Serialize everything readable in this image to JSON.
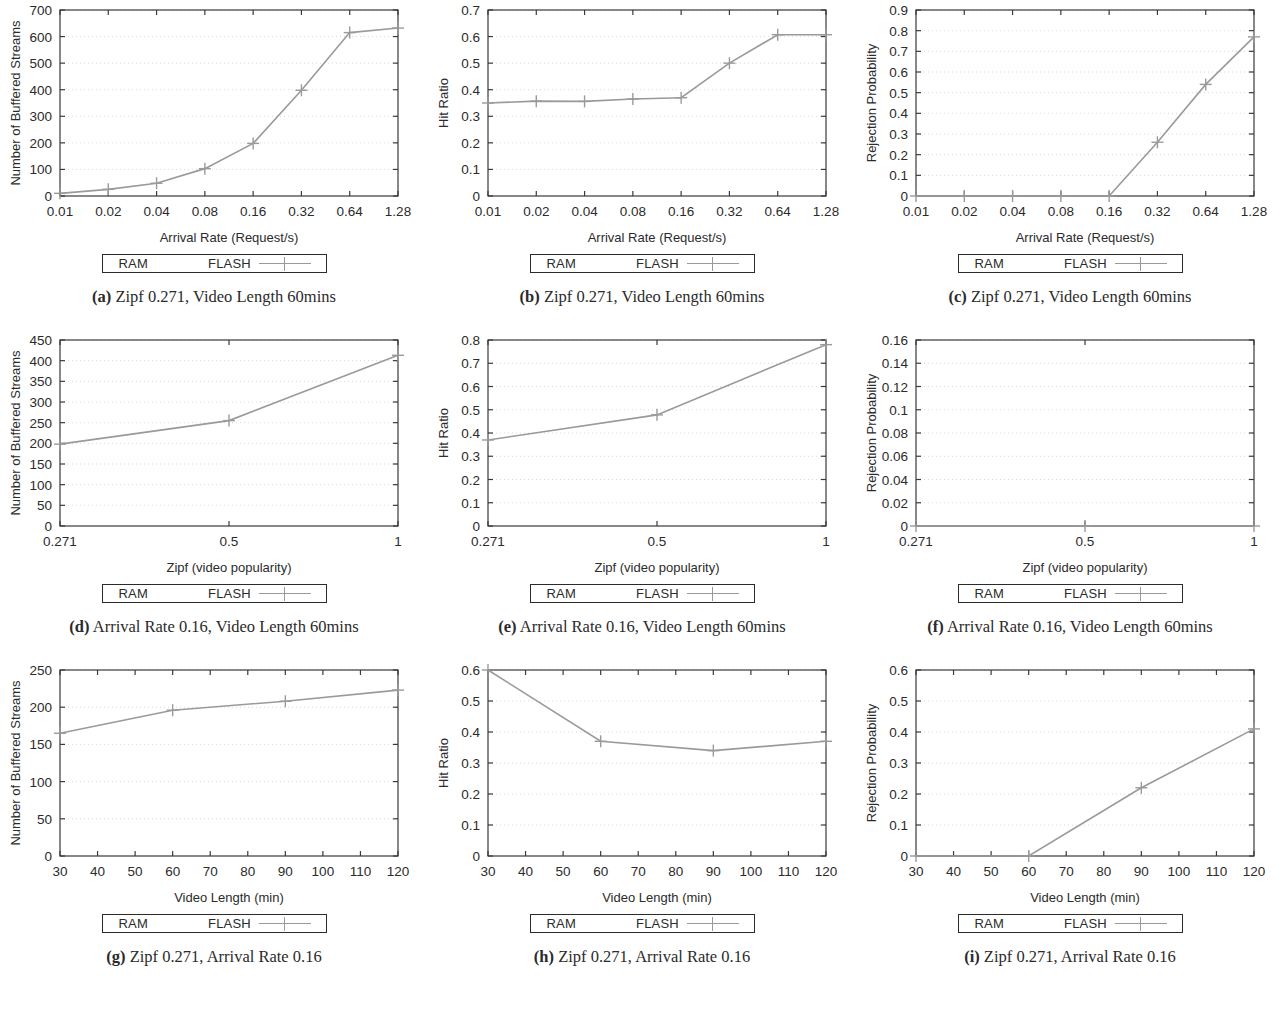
{
  "figure": {
    "legend": {
      "ram_label": "RAM",
      "flash_label": "FLASH"
    },
    "colors": {
      "line": "#9a9a9a",
      "grid": "#d8d8d8",
      "frame": "#3a3a3a",
      "text": "#2b2b2b"
    }
  },
  "chart_data": [
    {
      "id": "a",
      "type": "line",
      "caption_tag": "(a)",
      "caption": "Zipf 0.271, Video Length 60mins",
      "title": "",
      "xlabel": "Arrival Rate (Request/s)",
      "ylabel": "Number of Buffered Streams",
      "xticklabels": [
        "0.01",
        "0.02",
        "0.04",
        "0.08",
        "0.16",
        "0.32",
        "0.64",
        "1.28"
      ],
      "x": [
        1,
        2,
        3,
        4,
        5,
        6,
        7,
        8
      ],
      "yticks": [
        0,
        100,
        200,
        300,
        400,
        500,
        600,
        700
      ],
      "yticklabels": [
        "0",
        "100",
        "200",
        "300",
        "400",
        "500",
        "600",
        "700"
      ],
      "ylim": [
        0,
        700
      ],
      "grid": true,
      "legend_position": "below",
      "series": [
        {
          "name": "FLASH",
          "values": [
            10,
            25,
            48,
            103,
            198,
            398,
            615,
            632
          ]
        }
      ]
    },
    {
      "id": "b",
      "type": "line",
      "caption_tag": "(b)",
      "caption": "Zipf 0.271, Video Length 60mins",
      "title": "",
      "xlabel": "Arrival Rate (Request/s)",
      "ylabel": "Hit Ratio",
      "xticklabels": [
        "0.01",
        "0.02",
        "0.04",
        "0.08",
        "0.16",
        "0.32",
        "0.64",
        "1.28"
      ],
      "x": [
        1,
        2,
        3,
        4,
        5,
        6,
        7,
        8
      ],
      "yticks": [
        0,
        0.1,
        0.2,
        0.3,
        0.4,
        0.5,
        0.6,
        0.7
      ],
      "yticklabels": [
        "0",
        "0.1",
        "0.2",
        "0.3",
        "0.4",
        "0.5",
        "0.6",
        "0.7"
      ],
      "ylim": [
        0,
        0.7
      ],
      "grid": true,
      "legend_position": "below",
      "series": [
        {
          "name": "FLASH",
          "values": [
            0.35,
            0.357,
            0.356,
            0.365,
            0.37,
            0.5,
            0.607,
            0.607
          ]
        }
      ]
    },
    {
      "id": "c",
      "type": "line",
      "caption_tag": "(c)",
      "caption": "Zipf 0.271, Video Length 60mins",
      "title": "",
      "xlabel": "Arrival Rate (Request/s)",
      "ylabel": "Rejection Probability",
      "xticklabels": [
        "0.01",
        "0.02",
        "0.04",
        "0.08",
        "0.16",
        "0.32",
        "0.64",
        "1.28"
      ],
      "x": [
        1,
        2,
        3,
        4,
        5,
        6,
        7,
        8
      ],
      "yticks": [
        0,
        0.1,
        0.2,
        0.3,
        0.4,
        0.5,
        0.6,
        0.7,
        0.8,
        0.9
      ],
      "yticklabels": [
        "0",
        "0.1",
        "0.2",
        "0.3",
        "0.4",
        "0.5",
        "0.6",
        "0.7",
        "0.8",
        "0.9"
      ],
      "ylim": [
        0,
        0.9
      ],
      "grid": true,
      "legend_position": "below",
      "series": [
        {
          "name": "FLASH",
          "values": [
            0,
            0,
            0,
            0,
            0,
            0.26,
            0.54,
            0.77
          ]
        }
      ]
    },
    {
      "id": "d",
      "type": "line",
      "caption_tag": "(d)",
      "caption": "Arrival Rate 0.16, Video Length 60mins",
      "title": "",
      "xlabel": "Zipf (video popularity)",
      "ylabel": "Number of Buffered Streams",
      "xticklabels": [
        "0.271",
        "0.5",
        "1"
      ],
      "x": [
        0.271,
        0.5,
        1
      ],
      "yticks": [
        0,
        50,
        100,
        150,
        200,
        250,
        300,
        350,
        400,
        450
      ],
      "yticklabels": [
        "0",
        "50",
        "100",
        "150",
        "200",
        "250",
        "300",
        "350",
        "400",
        "450"
      ],
      "ylim": [
        0,
        450
      ],
      "grid": true,
      "legend_position": "below",
      "series": [
        {
          "name": "FLASH",
          "values": [
            198,
            255,
            413
          ]
        }
      ]
    },
    {
      "id": "e",
      "type": "line",
      "caption_tag": "(e)",
      "caption": "Arrival Rate 0.16, Video Length 60mins",
      "title": "",
      "xlabel": "Zipf (video popularity)",
      "ylabel": "Hit Ratio",
      "xticklabels": [
        "0.271",
        "0.5",
        "1"
      ],
      "x": [
        0.271,
        0.5,
        1
      ],
      "yticks": [
        0,
        0.1,
        0.2,
        0.3,
        0.4,
        0.5,
        0.6,
        0.7,
        0.8
      ],
      "yticklabels": [
        "0",
        "0.1",
        "0.2",
        "0.3",
        "0.4",
        "0.5",
        "0.6",
        "0.7",
        "0.8"
      ],
      "ylim": [
        0,
        0.8
      ],
      "grid": true,
      "legend_position": "below",
      "series": [
        {
          "name": "FLASH",
          "values": [
            0.37,
            0.478,
            0.78
          ]
        }
      ]
    },
    {
      "id": "f",
      "type": "line",
      "caption_tag": "(f)",
      "caption": "Arrival Rate 0.16, Video Length 60mins",
      "title": "",
      "xlabel": "Zipf (video popularity)",
      "ylabel": "Rejection Probability",
      "xticklabels": [
        "0.271",
        "0.5",
        "1"
      ],
      "x": [
        0.271,
        0.5,
        1
      ],
      "yticks": [
        0,
        0.02,
        0.04,
        0.06,
        0.08,
        0.1,
        0.12,
        0.14,
        0.16
      ],
      "yticklabels": [
        "0",
        "0.02",
        "0.04",
        "0.06",
        "0.08",
        "0.1",
        "0.12",
        "0.14",
        "0.16"
      ],
      "ylim": [
        0,
        0.16
      ],
      "grid": true,
      "legend_position": "below",
      "series": [
        {
          "name": "FLASH",
          "values": [
            0,
            0,
            0
          ]
        }
      ]
    },
    {
      "id": "g",
      "type": "line",
      "caption_tag": "(g)",
      "caption": "Zipf 0.271, Arrival Rate 0.16",
      "title": "",
      "xlabel": "Video Length (min)",
      "ylabel": "Number of Buffered Streams",
      "xticklabels": [
        "30",
        "40",
        "50",
        "60",
        "70",
        "80",
        "90",
        "100",
        "110",
        "120"
      ],
      "x": [
        30,
        60,
        90,
        120
      ],
      "xlim": [
        30,
        120
      ],
      "yticks": [
        0,
        50,
        100,
        150,
        200,
        250
      ],
      "yticklabels": [
        "0",
        "50",
        "100",
        "150",
        "200",
        "250"
      ],
      "ylim": [
        0,
        250
      ],
      "grid": true,
      "legend_position": "below",
      "series": [
        {
          "name": "FLASH",
          "values": [
            165,
            196,
            208,
            223
          ]
        }
      ]
    },
    {
      "id": "h",
      "type": "line",
      "caption_tag": "(h)",
      "caption": "Zipf 0.271, Arrival Rate 0.16",
      "title": "",
      "xlabel": "Video Length (min)",
      "ylabel": "Hit Ratio",
      "xticklabels": [
        "30",
        "40",
        "50",
        "60",
        "70",
        "80",
        "90",
        "100",
        "110",
        "120"
      ],
      "x": [
        30,
        60,
        90,
        120
      ],
      "xlim": [
        30,
        120
      ],
      "yticks": [
        0,
        0.1,
        0.2,
        0.3,
        0.4,
        0.5,
        0.6
      ],
      "yticklabels": [
        "0",
        "0.1",
        "0.2",
        "0.3",
        "0.4",
        "0.5",
        "0.6"
      ],
      "ylim": [
        0,
        0.6
      ],
      "grid": true,
      "legend_position": "below",
      "series": [
        {
          "name": "FLASH",
          "values": [
            0.6,
            0.37,
            0.34,
            0.37
          ]
        }
      ]
    },
    {
      "id": "i",
      "type": "line",
      "caption_tag": "(i)",
      "caption": "Zipf 0.271, Arrival Rate 0.16",
      "title": "",
      "xlabel": "Video Length (min)",
      "ylabel": "Rejection Probability",
      "xticklabels": [
        "30",
        "40",
        "50",
        "60",
        "70",
        "80",
        "90",
        "100",
        "110",
        "120"
      ],
      "x": [
        30,
        60,
        90,
        120
      ],
      "xlim": [
        30,
        120
      ],
      "yticks": [
        0,
        0.1,
        0.2,
        0.3,
        0.4,
        0.5,
        0.6
      ],
      "yticklabels": [
        "0",
        "0.1",
        "0.2",
        "0.3",
        "0.4",
        "0.5",
        "0.6"
      ],
      "ylim": [
        0,
        0.6
      ],
      "grid": true,
      "legend_position": "below",
      "series": [
        {
          "name": "FLASH",
          "values": [
            0,
            0,
            0.22,
            0.41
          ]
        }
      ]
    }
  ]
}
